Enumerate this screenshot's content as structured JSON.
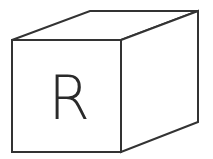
{
  "diagram": {
    "type": "cube",
    "front_face_label": "R",
    "colors": {
      "stroke": "#333333",
      "fill": "#ffffff",
      "label": "#2a2a2a"
    },
    "vertices": {
      "front_top_left": [
        12,
        40
      ],
      "front_top_right": [
        121,
        40
      ],
      "front_bottom_right": [
        121,
        152
      ],
      "front_bottom_left": [
        12,
        152
      ],
      "back_top_left": [
        90,
        11
      ],
      "back_top_right": [
        198,
        11
      ],
      "back_bottom_right": [
        198,
        122
      ]
    }
  }
}
